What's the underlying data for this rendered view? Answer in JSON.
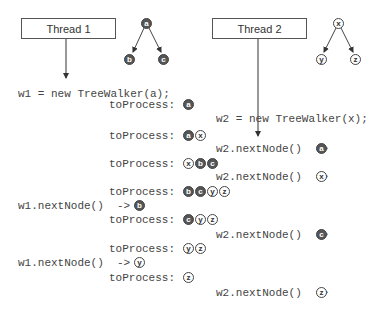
{
  "threads": [
    {
      "label": "Thread 1"
    },
    {
      "label": "Thread 2"
    }
  ],
  "trees": [
    {
      "root": "a",
      "children": [
        "b",
        "c"
      ],
      "style": "dark"
    },
    {
      "root": "x",
      "children": [
        "y",
        "z"
      ],
      "style": "light"
    }
  ],
  "steps": [
    {
      "code": "w1 = new TreeWalker(a);"
    },
    {
      "label": "toProcess:",
      "queue": [
        {
          "v": "a",
          "s": "dark"
        }
      ]
    },
    {
      "code": "w2 = new TreeWalker(x);"
    },
    {
      "label": "toProcess:",
      "queue": [
        {
          "v": "a",
          "s": "dark"
        },
        {
          "v": "x",
          "s": "light"
        }
      ]
    },
    {
      "code": "w2.nextNode()  ->",
      "result": {
        "v": "a",
        "s": "dark"
      }
    },
    {
      "label": "toProcess:",
      "queue": [
        {
          "v": "x",
          "s": "light"
        },
        {
          "v": "b",
          "s": "dark"
        },
        {
          "v": "c",
          "s": "dark"
        }
      ]
    },
    {
      "code": "w2.nextNode()  ->",
      "result": {
        "v": "x",
        "s": "light"
      }
    },
    {
      "label": "toProcess:",
      "queue": [
        {
          "v": "b",
          "s": "dark"
        },
        {
          "v": "c",
          "s": "dark"
        },
        {
          "v": "y",
          "s": "light"
        },
        {
          "v": "z",
          "s": "light"
        }
      ]
    },
    {
      "code": "w1.nextNode()  ->",
      "result": {
        "v": "b",
        "s": "dark"
      }
    },
    {
      "label": "toProcess:",
      "queue": [
        {
          "v": "c",
          "s": "dark"
        },
        {
          "v": "y",
          "s": "light"
        },
        {
          "v": "z",
          "s": "light"
        }
      ]
    },
    {
      "code": "w2.nextNode()  ->",
      "result": {
        "v": "c",
        "s": "dark"
      }
    },
    {
      "label": "toProcess:",
      "queue": [
        {
          "v": "y",
          "s": "light"
        },
        {
          "v": "z",
          "s": "light"
        }
      ]
    },
    {
      "code": "w1.nextNode()  ->",
      "result": {
        "v": "y",
        "s": "light"
      }
    },
    {
      "label": "toProcess:",
      "queue": [
        {
          "v": "z",
          "s": "light"
        }
      ]
    },
    {
      "code": "w2.nextNode()  ->",
      "result": {
        "v": "z",
        "s": "light"
      }
    }
  ]
}
